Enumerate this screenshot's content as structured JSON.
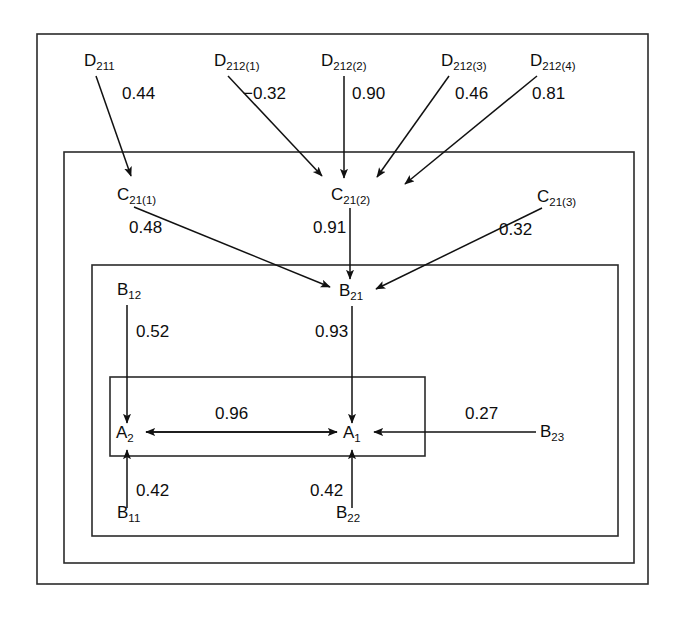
{
  "diagram": {
    "type": "path-diagram",
    "boxes": [
      {
        "id": "outer-box",
        "name": "outermost-frame",
        "x": 37,
        "y": 34,
        "width": 611,
        "height": 550
      },
      {
        "id": "d-level-box",
        "name": "c-level-frame",
        "x": 64,
        "y": 152,
        "width": 570,
        "height": 411
      },
      {
        "id": "c-level-box",
        "name": "b-level-frame",
        "x": 92,
        "y": 265,
        "width": 526,
        "height": 271
      },
      {
        "id": "a-level-box",
        "name": "a-level-frame",
        "x": 110,
        "y": 377,
        "width": 315,
        "height": 79
      }
    ],
    "nodes": [
      {
        "id": "D211",
        "base": "D",
        "sub": "211",
        "x": 84,
        "y": 66,
        "anchor": "start"
      },
      {
        "id": "D212_1",
        "base": "D",
        "sub": "212(1)",
        "x": 214,
        "y": 66,
        "anchor": "start"
      },
      {
        "id": "D212_2",
        "base": "D",
        "sub": "212(2)",
        "x": 321,
        "y": 66,
        "anchor": "start"
      },
      {
        "id": "D212_3",
        "base": "D",
        "sub": "212(3)",
        "x": 441,
        "y": 66,
        "anchor": "start"
      },
      {
        "id": "D212_4",
        "base": "D",
        "sub": "212(4)",
        "x": 530,
        "y": 66,
        "anchor": "start"
      },
      {
        "id": "C21_1",
        "base": "C",
        "sub": "21(1)",
        "x": 117,
        "y": 200,
        "anchor": "start"
      },
      {
        "id": "C21_2",
        "base": "C",
        "sub": "21(2)",
        "x": 331,
        "y": 200,
        "anchor": "start"
      },
      {
        "id": "C21_3",
        "base": "C",
        "sub": "21(3)",
        "x": 537,
        "y": 202,
        "anchor": "start"
      },
      {
        "id": "B21",
        "base": "B",
        "sub": "21",
        "x": 339,
        "y": 296,
        "anchor": "start"
      },
      {
        "id": "B12",
        "base": "B",
        "sub": "12",
        "x": 117,
        "y": 295,
        "anchor": "start"
      },
      {
        "id": "B11",
        "base": "B",
        "sub": "11",
        "x": 117,
        "y": 518,
        "anchor": "start"
      },
      {
        "id": "B22",
        "base": "B",
        "sub": "22",
        "x": 336,
        "y": 518,
        "anchor": "start"
      },
      {
        "id": "B23",
        "base": "B",
        "sub": "23",
        "x": 540,
        "y": 437,
        "anchor": "start"
      },
      {
        "id": "A2",
        "base": "A",
        "sub": "2",
        "x": 116,
        "y": 438,
        "anchor": "start"
      },
      {
        "id": "A1",
        "base": "A",
        "sub": "1",
        "x": 343,
        "y": 438,
        "anchor": "start"
      }
    ],
    "edges": [
      {
        "from": "D211",
        "to": "C21_1",
        "coefficient": "0.44",
        "label_x": 122,
        "label_y": 99
      },
      {
        "from": "D212_1",
        "to": "C21_2",
        "coefficient": "−0.32",
        "label_x": 243,
        "label_y": 99
      },
      {
        "from": "D212_2",
        "to": "C21_2",
        "coefficient": "0.90",
        "label_x": 352,
        "label_y": 99
      },
      {
        "from": "D212_3",
        "to": "C21_2",
        "coefficient": "0.46",
        "label_x": 455,
        "label_y": 99
      },
      {
        "from": "D212_4",
        "to": "C21_2",
        "coefficient": "0.81",
        "label_x": 532,
        "label_y": 99
      },
      {
        "from": "C21_1",
        "to": "B21",
        "coefficient": "0.48",
        "label_x": 129,
        "label_y": 233
      },
      {
        "from": "C21_2",
        "to": "B21",
        "coefficient": "0.91",
        "label_x": 313,
        "label_y": 233
      },
      {
        "from": "C21_3",
        "to": "B21",
        "coefficient": "0.32",
        "label_x": 499,
        "label_y": 235
      },
      {
        "from": "B12",
        "to": "A2",
        "coefficient": "0.52",
        "label_x": 136,
        "label_y": 337
      },
      {
        "from": "B21",
        "to": "A1",
        "coefficient": "0.93",
        "label_x": 315,
        "label_y": 337
      },
      {
        "from": "A2",
        "to": "A1",
        "coefficient": "0.96",
        "label_x": 215,
        "label_y": 419
      },
      {
        "from": "A1",
        "to": "A2",
        "coefficient": "",
        "label_x": 0,
        "label_y": 0
      },
      {
        "from": "B23",
        "to": "A1",
        "coefficient": "0.27",
        "label_x": 465,
        "label_y": 419
      },
      {
        "from": "B11",
        "to": "A2",
        "coefficient": "0.42",
        "label_x": 136,
        "label_y": 496
      },
      {
        "from": "B22",
        "to": "A1",
        "coefficient": "0.42",
        "label_x": 310,
        "label_y": 496
      }
    ],
    "colors": {
      "stroke": "#111111",
      "box_stroke": "#2b2b2b",
      "background": "#ffffff"
    }
  }
}
